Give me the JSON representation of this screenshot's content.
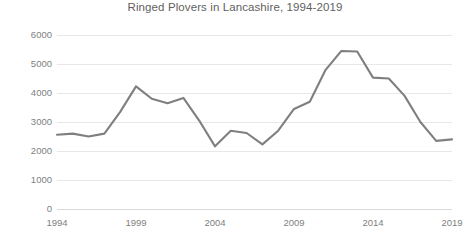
{
  "chart_data": {
    "type": "line",
    "title": "Ringed Plovers in Lancashire, 1994-2019",
    "xlabel": "",
    "ylabel": "",
    "x": [
      1994,
      1995,
      1996,
      1997,
      1998,
      1999,
      2000,
      2001,
      2002,
      2003,
      2004,
      2005,
      2006,
      2007,
      2008,
      2009,
      2010,
      2011,
      2012,
      2013,
      2014,
      2015,
      2016,
      2017,
      2018,
      2019
    ],
    "values": [
      2560,
      2600,
      2500,
      2600,
      3350,
      4230,
      3800,
      3650,
      3830,
      3050,
      2160,
      2700,
      2620,
      2230,
      2700,
      3450,
      3700,
      4800,
      5450,
      5430,
      4530,
      4500,
      3900,
      3000,
      2350,
      2400
    ],
    "series": [
      {
        "name": "Ringed Plovers",
        "values": [
          2560,
          2600,
          2500,
          2600,
          3350,
          4230,
          3800,
          3650,
          3830,
          3050,
          2160,
          2700,
          2620,
          2230,
          2700,
          3450,
          3700,
          4800,
          5450,
          5430,
          4530,
          4500,
          3900,
          3000,
          2350,
          2400
        ]
      }
    ],
    "xlim": [
      1994,
      2019
    ],
    "ylim": [
      0,
      6000
    ],
    "x_ticks": [
      "1994",
      "1999",
      "2004",
      "2009",
      "2014",
      "2019"
    ],
    "x_tick_values": [
      1994,
      1999,
      2004,
      2009,
      2014,
      2019
    ],
    "y_ticks": [
      "0",
      "1000",
      "2000",
      "3000",
      "4000",
      "5000",
      "6000"
    ],
    "y_tick_values": [
      0,
      1000,
      2000,
      3000,
      4000,
      5000,
      6000
    ],
    "grid": "horizontal",
    "legend": "none",
    "colors": {
      "line": "#7f7f7f",
      "grid": "#e8e8e8",
      "text": "#808080",
      "title": "#5f5f5f",
      "background": "#ffffff"
    }
  }
}
